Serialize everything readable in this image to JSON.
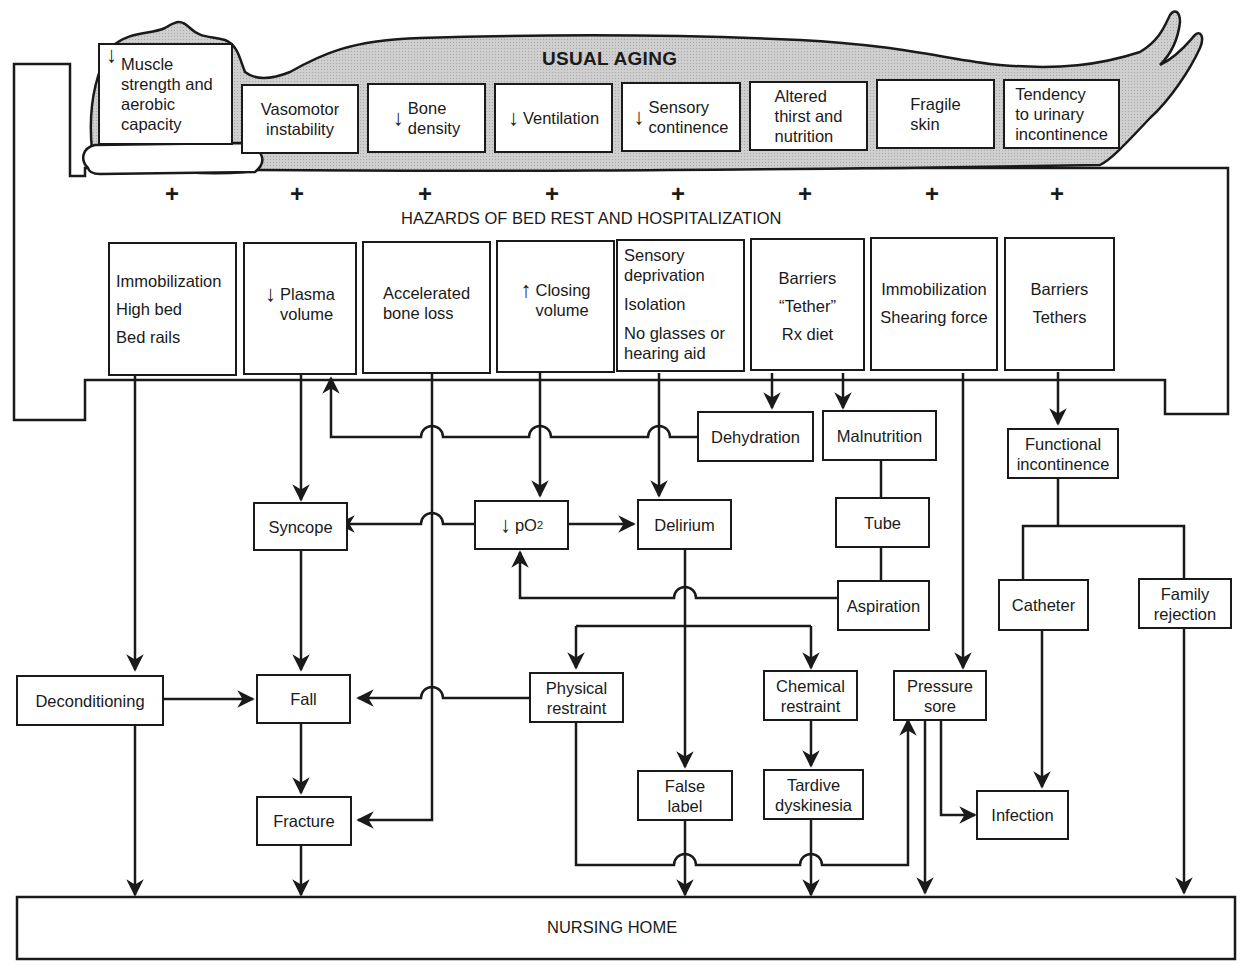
{
  "titles": {
    "usual_aging": "USUAL AGING",
    "hazards": "HAZARDS OF BED REST AND HOSPITALIZATION",
    "nursing_home": "NURSING HOME"
  },
  "plus_sign": "+",
  "aging_boxes": [
    {
      "arrow": "↓",
      "lines": [
        "Muscle",
        "strength and",
        "aerobic",
        "capacity"
      ]
    },
    {
      "arrow": "",
      "lines": [
        "Vasomotor",
        "instability"
      ]
    },
    {
      "arrow": "↓",
      "lines": [
        "Bone",
        "density"
      ]
    },
    {
      "arrow": "↓",
      "lines": [
        "Ventilation"
      ]
    },
    {
      "arrow": "↓",
      "lines": [
        "Sensory",
        "continence"
      ]
    },
    {
      "arrow": "",
      "lines": [
        "Altered",
        "thirst and",
        "nutrition"
      ]
    },
    {
      "arrow": "",
      "lines": [
        "Fragile",
        "skin"
      ]
    },
    {
      "arrow": "",
      "lines": [
        "Tendency",
        "to urinary",
        "incontinence"
      ]
    }
  ],
  "hazard_boxes": [
    {
      "arrow": "",
      "lines": [
        "Immobilization",
        "High bed",
        "Bed rails"
      ]
    },
    {
      "arrow": "↓",
      "lines": [
        "Plasma",
        "volume"
      ]
    },
    {
      "arrow": "",
      "lines": [
        "Accelerated",
        "bone loss"
      ]
    },
    {
      "arrow": "↑",
      "lines": [
        "Closing",
        "volume"
      ]
    },
    {
      "arrow": "",
      "lines": [
        "Sensory",
        "deprivation",
        "Isolation",
        "No glasses or",
        "hearing aid"
      ]
    },
    {
      "arrow": "",
      "lines": [
        "Barriers",
        "“Tether”",
        "Rx diet"
      ]
    },
    {
      "arrow": "",
      "lines": [
        "Immobilization",
        "Shearing force"
      ]
    },
    {
      "arrow": "",
      "lines": [
        "Barriers",
        "Tethers"
      ]
    }
  ],
  "outcome_nodes": {
    "dehydration": "Dehydration",
    "malnutrition": "Malnutrition",
    "functional_incontinence": [
      "Functional",
      "incontinence"
    ],
    "syncope": "Syncope",
    "po2_arrow": "↓",
    "po2": "pO",
    "po2_sub": "2",
    "delirium": "Delirium",
    "tube": "Tube",
    "aspiration": "Aspiration",
    "catheter": "Catheter",
    "family_rejection": [
      "Family",
      "rejection"
    ],
    "deconditioning": "Deconditioning",
    "fall": "Fall",
    "physical_restraint": [
      "Physical",
      "restraint"
    ],
    "chemical_restraint": [
      "Chemical",
      "restraint"
    ],
    "pressure_sore": [
      "Pressure",
      "sore"
    ],
    "false_label": [
      "False",
      "label"
    ],
    "tardive_dyskinesia": [
      "Tardive",
      "dyskinesia"
    ],
    "fracture": "Fracture",
    "infection": "Infection"
  },
  "colors": {
    "body_fill": "#c9c9c9",
    "line": "#1a1a1a",
    "background": "#ffffff"
  }
}
